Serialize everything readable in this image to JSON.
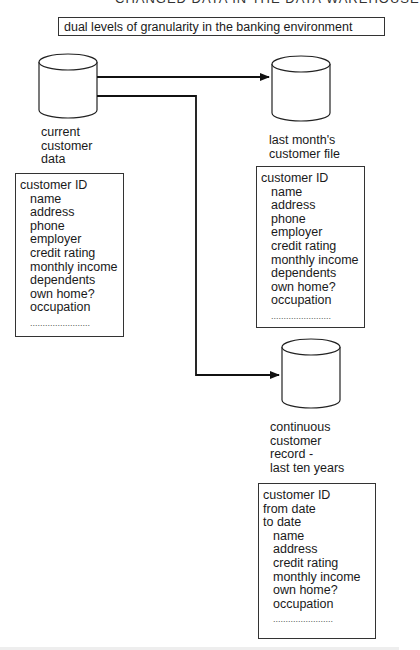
{
  "header": {
    "clipped_text": "CHANGED DATA IN THE DATA WAREHOUSE"
  },
  "title": "dual levels of granularity in the banking environment",
  "stores": [
    {
      "label": "current\ncustomer\ndata",
      "record": {
        "key_fields": [
          "customer ID"
        ],
        "fields": [
          "name",
          "address",
          "phone",
          "employer",
          "credit rating",
          "monthly income",
          "dependents",
          "own home?",
          "occupation"
        ],
        "ellipsis": "........................"
      }
    },
    {
      "label": "last month's\ncustomer file",
      "record": {
        "key_fields": [
          "customer ID"
        ],
        "fields": [
          "name",
          "address",
          "phone",
          "employer",
          "credit rating",
          "monthly income",
          "dependents",
          "own home?",
          "occupation"
        ],
        "ellipsis": "........................"
      }
    },
    {
      "label": "continuous\ncustomer\nrecord -\nlast ten years",
      "record": {
        "key_fields": [
          "customer ID",
          "from date",
          "to date"
        ],
        "fields": [
          "name",
          "address",
          "credit rating",
          "monthly income",
          "own home?",
          "occupation"
        ],
        "ellipsis": "........................"
      }
    }
  ],
  "arrows": [
    {
      "from": "current customer data",
      "to": "last month's customer file"
    },
    {
      "from": "current customer data",
      "to": "continuous customer record - last ten years"
    }
  ]
}
